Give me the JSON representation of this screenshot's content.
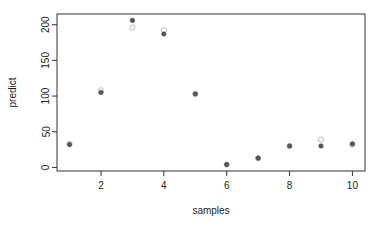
{
  "chart_data": {
    "type": "scatter",
    "title": "",
    "xlabel": "samples",
    "ylabel": "predict",
    "xlim": [
      0.6,
      10.4
    ],
    "ylim": [
      -5,
      215
    ],
    "xticks": [
      2,
      4,
      6,
      8,
      10
    ],
    "yticks": [
      0,
      50,
      100,
      150,
      200
    ],
    "grid": false,
    "legend": null,
    "x": [
      1,
      2,
      3,
      4,
      5,
      6,
      7,
      8,
      9,
      10
    ],
    "series": [
      {
        "name": "actual",
        "marker": "open-circle",
        "color": "#bdbdbd",
        "values": [
          33,
          108,
          196,
          192,
          103,
          4,
          13,
          30,
          39,
          32
        ]
      },
      {
        "name": "predict",
        "marker": "filled-circle",
        "color": "#555555",
        "values": [
          32,
          105,
          206,
          187,
          103,
          4,
          13,
          30,
          30,
          33
        ]
      }
    ]
  },
  "layout": {
    "plot": {
      "left": 57,
      "top": 14,
      "right": 365,
      "bottom": 171
    },
    "colors": {
      "axis": "#333333",
      "text": "#222222"
    }
  }
}
